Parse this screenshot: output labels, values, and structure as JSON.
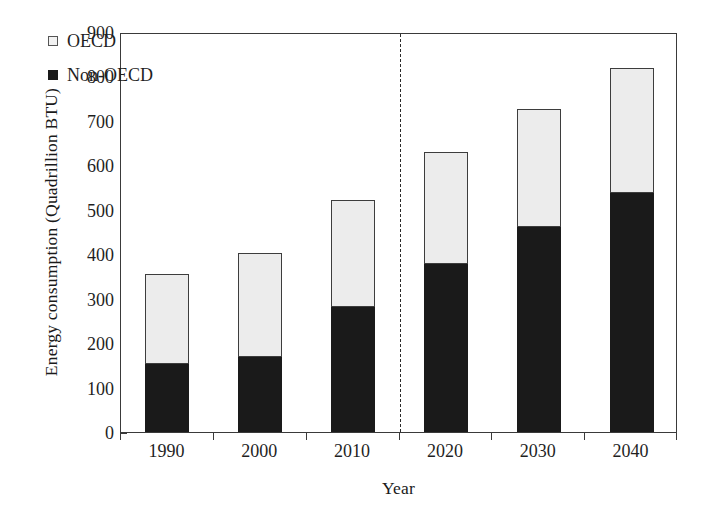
{
  "chart_data": {
    "type": "bar",
    "stacked": true,
    "title": "",
    "xlabel": "Year",
    "ylabel": "Energy consumption (Quadrillion BTU)",
    "categories": [
      "1990",
      "2000",
      "2010",
      "2020",
      "2030",
      "2040"
    ],
    "series": [
      {
        "name": "Non-OECD",
        "color": "#1a1a1a",
        "values": [
          153,
          169,
          281,
          378,
          461,
          538
        ]
      },
      {
        "name": "OECD",
        "color": "#ececec",
        "values": [
          202,
          234,
          241,
          252,
          266,
          281
        ]
      }
    ],
    "totals": [
      355,
      403,
      522,
      630,
      727,
      819
    ],
    "ylim": [
      0,
      900
    ],
    "yticks": [
      0,
      100,
      200,
      300,
      400,
      500,
      600,
      700,
      800,
      900
    ],
    "ytick_labels": [
      "0",
      "100",
      "200",
      "300",
      "400",
      "500",
      "600",
      "700",
      "800",
      "900"
    ],
    "grid": false,
    "legend_position": "top-left",
    "legend": [
      {
        "label": "OECD",
        "marker": "open-square"
      },
      {
        "label": "Non-OECD",
        "marker": "filled-square"
      }
    ],
    "annotations": [
      {
        "type": "vertical-dashed-line",
        "at_x": 2.5,
        "label": "history/projection divider"
      }
    ]
  }
}
